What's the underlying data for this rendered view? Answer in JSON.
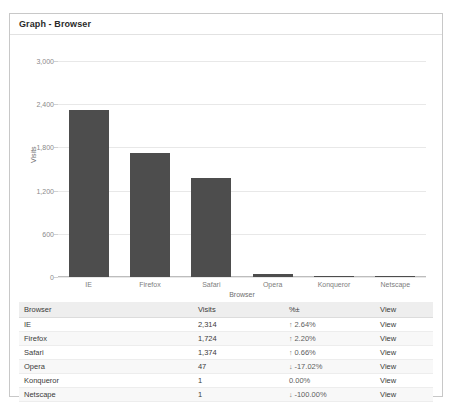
{
  "panel": {
    "title": "Graph - Browser"
  },
  "chart_data": {
    "type": "bar",
    "title": "Graph - Browser",
    "xlabel": "Browser",
    "ylabel": "Visits",
    "categories": [
      "IE",
      "Firefox",
      "Safari",
      "Opera",
      "Konqueror",
      "Netscape"
    ],
    "values": [
      2314,
      1724,
      1374,
      47,
      1,
      1
    ],
    "ylim": [
      0,
      3000
    ],
    "yticks": [
      "0",
      "600",
      "1,200",
      "1,800",
      "2,400",
      "3,000"
    ],
    "ytick_values": [
      0,
      600,
      1200,
      1800,
      2400,
      3000
    ],
    "grid": true,
    "legend": "none",
    "bar_color": "#4d4d4d"
  },
  "table": {
    "columns": [
      "Browser",
      "Visits",
      "%±",
      "View"
    ],
    "rows": [
      {
        "browser": "IE",
        "visits": "2,314",
        "arrow": "↑",
        "direction": "up",
        "pct": "2.64%",
        "view": "View"
      },
      {
        "browser": "Firefox",
        "visits": "1,724",
        "arrow": "↑",
        "direction": "up",
        "pct": "2.20%",
        "view": "View"
      },
      {
        "browser": "Safari",
        "visits": "1,374",
        "arrow": "↑",
        "direction": "up",
        "pct": "0.66%",
        "view": "View"
      },
      {
        "browser": "Opera",
        "visits": "47",
        "arrow": "↓",
        "direction": "down",
        "pct": "-17.02%",
        "view": "View"
      },
      {
        "browser": "Konqueror",
        "visits": "1",
        "arrow": "",
        "direction": "none",
        "pct": "0.00%",
        "view": "View"
      },
      {
        "browser": "Netscape",
        "visits": "1",
        "arrow": "↓",
        "direction": "down",
        "pct": "-100.00%",
        "view": "View"
      }
    ]
  }
}
